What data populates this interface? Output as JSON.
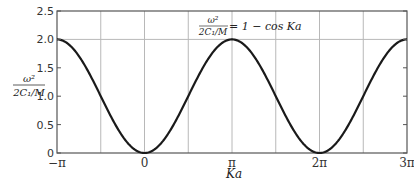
{
  "chart_data": {
    "type": "line",
    "title": "",
    "xlabel": "Ka",
    "ylabel": "ω²/(2C₁/M)",
    "ylabel_parts": {
      "num": "ω²",
      "den": "2C₁/M"
    },
    "annotation": {
      "lhs_num": "ω²",
      "lhs_den": "2C₁/M",
      "rhs": "= 1 − cos Ka"
    },
    "series": [
      {
        "name": "ω²/(2C₁/M) = 1 − cos Ka",
        "x": [
          -3.1416,
          -2.3562,
          -1.5708,
          -0.7854,
          0,
          0.7854,
          1.5708,
          2.3562,
          3.1416,
          3.927,
          4.7124,
          5.4978,
          6.2832,
          7.0686,
          7.854,
          8.6394,
          9.4248
        ],
        "values": [
          2.0,
          1.707,
          1.0,
          0.293,
          0.0,
          0.293,
          1.0,
          1.707,
          2.0,
          1.707,
          1.0,
          0.293,
          0.0,
          0.293,
          1.0,
          1.707,
          2.0
        ]
      }
    ],
    "xlim": [
      -3.1416,
      9.4248
    ],
    "ylim": [
      0,
      2.5
    ],
    "xticks": [
      {
        "value": -3.1416,
        "label": "−π"
      },
      {
        "value": 0,
        "label": "0"
      },
      {
        "value": 3.1416,
        "label": "π"
      },
      {
        "value": 6.2832,
        "label": "2π"
      },
      {
        "value": 9.4248,
        "label": "3π"
      }
    ],
    "yticks": [
      {
        "value": 0,
        "label": "0"
      },
      {
        "value": 0.5,
        "label": "0.5"
      },
      {
        "value": 1.0,
        "label": "1.0"
      },
      {
        "value": 1.5,
        "label": "1.5"
      },
      {
        "value": 2.0,
        "label": "2.0"
      },
      {
        "value": 2.5,
        "label": "2.5"
      }
    ],
    "grid": {
      "vertical_every": 1.5708,
      "horizontal_at": [
        2.0
      ]
    },
    "legend": "none",
    "colors": {
      "curve": "#1a1a1a",
      "grid": "#b8b8b8",
      "frame": "#555555"
    }
  }
}
